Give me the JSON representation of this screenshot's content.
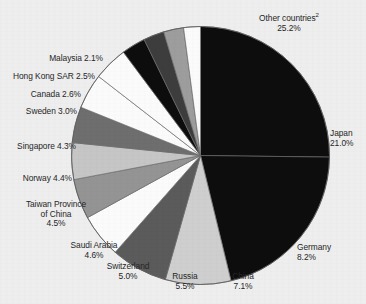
{
  "figure": {
    "background_color": "#eeeeee",
    "text_color": "#262626",
    "footnote_marker": "2"
  },
  "chart_data": {
    "type": "pie",
    "title": "",
    "subtitle": "",
    "xlabel": "",
    "ylabel": "",
    "legend_position": "outside-labels",
    "grid": false,
    "units": "percent",
    "total": 100.0,
    "start_angle_deg": 0,
    "direction": "clockwise",
    "categories": [
      "Other countries",
      "Japan",
      "Germany",
      "China",
      "Russia",
      "Switzerland",
      "Saudi Arabia",
      "Taiwan Province of China",
      "Norway",
      "Singapore",
      "Sweden",
      "Canada",
      "Hong Kong SAR",
      "Malaysia"
    ],
    "values": [
      25.2,
      21.0,
      8.2,
      7.1,
      5.5,
      5.0,
      4.6,
      4.5,
      4.4,
      4.3,
      3.0,
      2.6,
      2.5,
      2.1
    ],
    "colors": [
      "#0d0d0d",
      "#0d0d0d",
      "#cfcfcf",
      "#5b5b5b",
      "#fbfbfb",
      "#949494",
      "#c6c6c6",
      "#6e6e6e",
      "#fbfbfb",
      "#fbfbfb",
      "#0d0d0d",
      "#3d3d3d",
      "#9d9d9d",
      "#fbfbfb"
    ],
    "slices": [
      {
        "label": "Other countries",
        "value": 25.2,
        "value_text": "25.2%",
        "color": "#0d0d0d",
        "has_footnote": true
      },
      {
        "label": "Japan",
        "value": 21.0,
        "value_text": "21.0%",
        "color": "#0d0d0d",
        "has_footnote": false
      },
      {
        "label": "Germany",
        "value": 8.2,
        "value_text": "8.2%",
        "color": "#cfcfcf",
        "has_footnote": false
      },
      {
        "label": "China",
        "value": 7.1,
        "value_text": "7.1%",
        "color": "#5b5b5b",
        "has_footnote": false
      },
      {
        "label": "Russia",
        "value": 5.5,
        "value_text": "5.5%",
        "color": "#fbfbfb",
        "has_footnote": false
      },
      {
        "label": "Switzerland",
        "value": 5.0,
        "value_text": "5.0%",
        "color": "#949494",
        "has_footnote": false
      },
      {
        "label": "Saudi Arabia",
        "value": 4.6,
        "value_text": "4.6%",
        "color": "#c6c6c6",
        "has_footnote": false
      },
      {
        "label": "Taiwan Province of China",
        "value": 4.5,
        "value_text": "4.5%",
        "color": "#6e6e6e",
        "has_footnote": false
      },
      {
        "label": "Norway",
        "value": 4.4,
        "value_text": "4.4%",
        "color": "#fbfbfb",
        "has_footnote": false
      },
      {
        "label": "Singapore",
        "value": 4.3,
        "value_text": "4.3%",
        "color": "#fbfbfb",
        "has_footnote": false
      },
      {
        "label": "Sweden",
        "value": 3.0,
        "value_text": "3.0%",
        "color": "#0d0d0d",
        "has_footnote": false
      },
      {
        "label": "Canada",
        "value": 2.6,
        "value_text": "2.6%",
        "color": "#3d3d3d",
        "has_footnote": false
      },
      {
        "label": "Hong Kong SAR",
        "value": 2.5,
        "value_text": "2.5%",
        "color": "#9d9d9d",
        "has_footnote": false
      },
      {
        "label": "Malaysia",
        "value": 2.1,
        "value_text": "2.1%",
        "color": "#fbfbfb",
        "has_footnote": false
      }
    ]
  },
  "labels": {
    "other_countries": {
      "name": "Other countries",
      "pct": "25.2%"
    },
    "japan": {
      "name": "Japan",
      "pct": "21.0%"
    },
    "germany": {
      "name": "Germany",
      "pct": "8.2%"
    },
    "china": {
      "name": "China",
      "pct": "7.1%"
    },
    "russia": {
      "name": "Russia",
      "pct": "5.5%"
    },
    "switzerland": {
      "name": "Switzerland",
      "pct": "5.0%"
    },
    "saudi_arabia": {
      "name": "Saudi Arabia",
      "pct": "4.6%"
    },
    "taiwan": {
      "name_line1": "Taiwan Province",
      "name_line2": "of China",
      "pct": "4.5%"
    },
    "norway": {
      "text": "Norway 4.4%"
    },
    "singapore": {
      "text": "Singapore 4.3%"
    },
    "sweden": {
      "text": "Sweden 3.0%"
    },
    "canada": {
      "text": "Canada 2.6%"
    },
    "hong_kong": {
      "text": "Hong Kong SAR 2.5%"
    },
    "malaysia": {
      "text": "Malaysia 2.1%"
    }
  }
}
